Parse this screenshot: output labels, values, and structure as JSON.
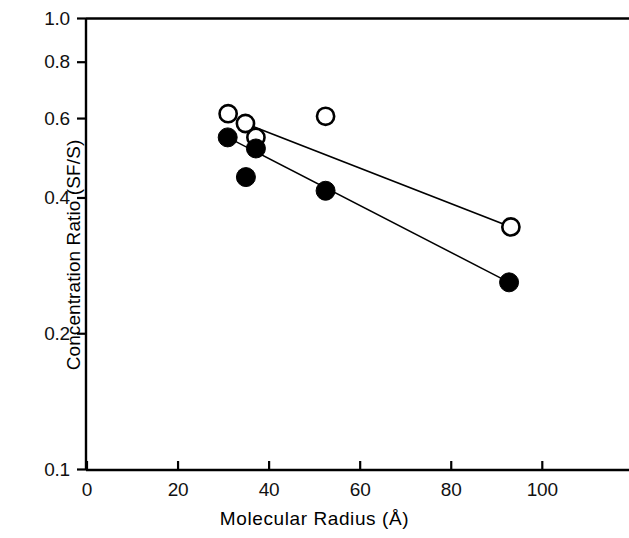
{
  "chart_data": {
    "type": "scatter",
    "title": "",
    "xlabel": "Molecular Radius (Å)",
    "ylabel": "Concentration Ratio (SF/S)",
    "xlim": [
      0,
      120
    ],
    "ylim": [
      0.1,
      1.0
    ],
    "yscale": "log",
    "xscale": "linear",
    "grid": false,
    "legend": "none",
    "xticks": [
      0,
      20,
      40,
      60,
      80,
      100
    ],
    "xtick_labels": [
      "0",
      "20",
      "40",
      "60",
      "80",
      "100"
    ],
    "yticks": [
      1.0,
      0.8,
      0.6,
      0.4,
      0.2,
      0.1
    ],
    "ytick_labels": [
      "1.0",
      "0.8",
      "0.6",
      "0.4",
      "0.2",
      "0.1"
    ],
    "series": [
      {
        "name": "open-circles",
        "marker": "open-circle",
        "color": "#000000",
        "points": [
          {
            "x": 31.0,
            "y": 0.615
          },
          {
            "x": 34.8,
            "y": 0.585
          },
          {
            "x": 37.1,
            "y": 0.545
          },
          {
            "x": 52.4,
            "y": 0.607
          },
          {
            "x": 93.1,
            "y": 0.345
          }
        ],
        "fit_line": {
          "x1": 34.8,
          "y1": 0.585,
          "x2": 93.1,
          "y2": 0.345
        }
      },
      {
        "name": "filled-circles",
        "marker": "filled-circle",
        "color": "#000000",
        "points": [
          {
            "x": 30.9,
            "y": 0.545
          },
          {
            "x": 34.9,
            "y": 0.445
          },
          {
            "x": 37.1,
            "y": 0.515
          },
          {
            "x": 52.4,
            "y": 0.415
          },
          {
            "x": 92.7,
            "y": 0.26
          }
        ],
        "fit_line": {
          "x1": 30.9,
          "y1": 0.545,
          "x2": 92.7,
          "y2": 0.26
        }
      }
    ]
  }
}
